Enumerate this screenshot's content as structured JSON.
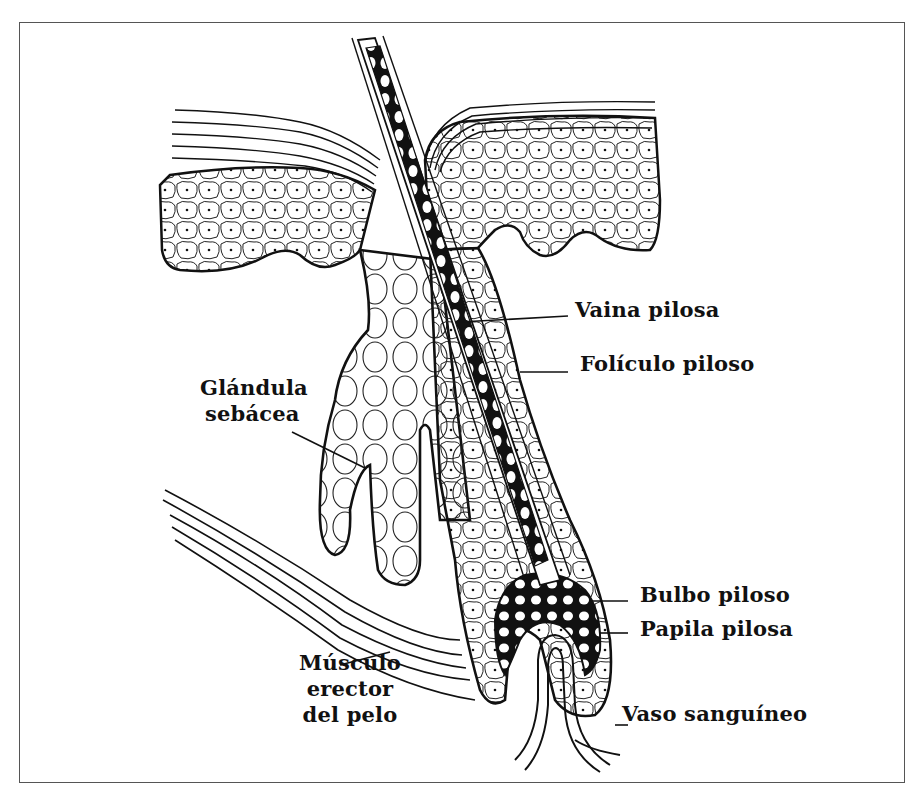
{
  "diagram": {
    "type": "anatomy",
    "colors": {
      "ink": "#111111",
      "background": "#ffffff",
      "frame": "#555555"
    },
    "labels": [
      {
        "id": "vaina",
        "text": "Vaina pilosa"
      },
      {
        "id": "foliculo",
        "text": "Folículo piloso"
      },
      {
        "id": "glandula",
        "line1": "Glándula",
        "line2": "sebácea"
      },
      {
        "id": "bulbo",
        "text": "Bulbo piloso"
      },
      {
        "id": "papila",
        "text": "Papila pilosa"
      },
      {
        "id": "musculo",
        "line1": "Músculo",
        "line2": "erector",
        "line3": "del pelo"
      },
      {
        "id": "vaso",
        "text": "Vaso sanguíneo"
      }
    ]
  }
}
